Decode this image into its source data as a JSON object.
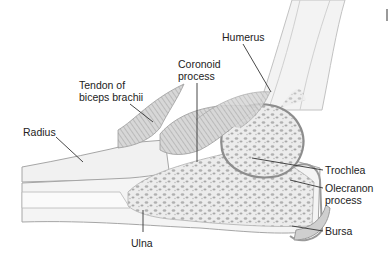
{
  "figure": {
    "colors": {
      "bone_fill": "#f2f2f2",
      "bone_outline": "#9a9a9a",
      "spongy_bone": "#b5b5b5",
      "muscle": "#a9a9a9",
      "leader_line": "#333333",
      "text": "#222222"
    }
  },
  "labels": {
    "humerus": {
      "lines": [
        "Humerus"
      ]
    },
    "coronoid": {
      "lines": [
        "Coronoid",
        "process"
      ]
    },
    "tendon": {
      "lines": [
        "Tendon of",
        "biceps brachii"
      ]
    },
    "radius": {
      "lines": [
        "Radius"
      ]
    },
    "trochlea": {
      "lines": [
        "Trochlea"
      ]
    },
    "olecranon": {
      "lines": [
        "Olecranon",
        "process"
      ]
    },
    "bursa": {
      "lines": [
        "Bursa"
      ]
    },
    "ulna": {
      "lines": [
        "Ulna"
      ]
    }
  }
}
